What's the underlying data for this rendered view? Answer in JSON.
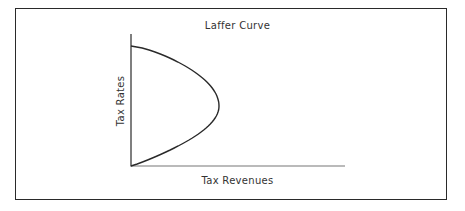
{
  "chart_data": {
    "type": "line",
    "title": "Laffer Curve",
    "xlabel": "Tax Revenues",
    "ylabel": "Tax Rates",
    "grid": false,
    "legend": null,
    "ticks": false,
    "series": [
      {
        "name": "Laffer Curve",
        "points": [
          {
            "x": 0,
            "y": 0
          },
          {
            "x": 0.35,
            "y": 0.08
          },
          {
            "x": 0.67,
            "y": 0.2
          },
          {
            "x": 0.9,
            "y": 0.35
          },
          {
            "x": 1.0,
            "y": 0.5
          },
          {
            "x": 0.9,
            "y": 0.65
          },
          {
            "x": 0.67,
            "y": 0.82
          },
          {
            "x": 0.35,
            "y": 0.96
          },
          {
            "x": 0,
            "y": 1.0
          }
        ]
      }
    ],
    "xlim": [
      0,
      2.4
    ],
    "ylim": [
      0,
      1.1
    ]
  },
  "colors": {
    "line": "#2a2a2a",
    "axis": "#555555",
    "frame": "#2a2a2a",
    "background": "#ffffff"
  }
}
